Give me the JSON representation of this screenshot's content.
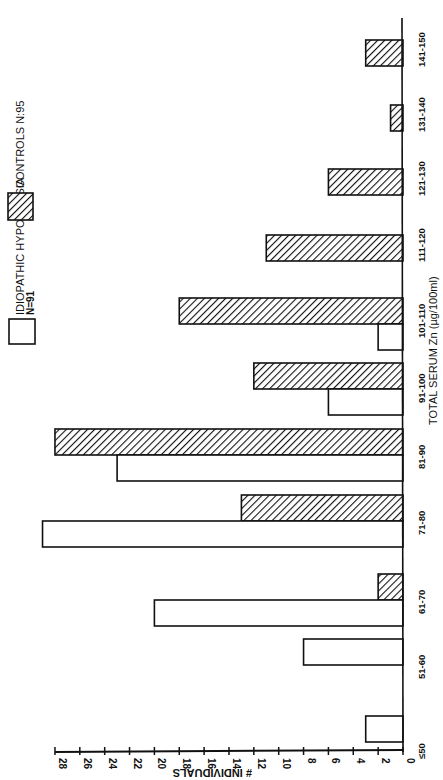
{
  "chart_data": {
    "type": "bar",
    "orientation": "rotated 90° counter-clockwise (value axis along bottom, categories along right)",
    "title": "",
    "xlabel": "TOTAL SERUM Zn (µg/100ml)",
    "ylabel": "# INDIVIDUALS",
    "ylim": [
      0,
      28
    ],
    "yticks": [
      0,
      2,
      4,
      6,
      8,
      10,
      12,
      14,
      16,
      18,
      20,
      22,
      24,
      26,
      28
    ],
    "grid": false,
    "legend_position": "top-left (rotated)",
    "categories": [
      "≤50",
      "51-60",
      "61-70",
      "71-80",
      "81-90",
      "91-100",
      "101-110",
      "111-120",
      "121-130",
      "131-140",
      "141-150"
    ],
    "series": [
      {
        "name": "IDIOPATHIC HYPOGEUSIA N=91",
        "style": "open",
        "values": [
          3,
          8,
          20,
          29,
          23,
          6,
          2,
          0,
          0,
          0,
          0
        ]
      },
      {
        "name": "CONTROLS N=95",
        "style": "hatched",
        "values": [
          0,
          0,
          2,
          13,
          28,
          12,
          18,
          11,
          6,
          1,
          3
        ]
      }
    ]
  },
  "legend": {
    "open_label_line1": "IDIOPATHIC HYPOGEUSIA",
    "open_label_line2": "N=91",
    "hatched_label": "CONTROLS   N:95"
  },
  "axis": {
    "value_label": "# INDIVIDUALS",
    "category_label": "TOTAL SERUM Zn (µg/100ml)"
  },
  "colors": {
    "ink": "#111111",
    "background": "#ffffff"
  }
}
